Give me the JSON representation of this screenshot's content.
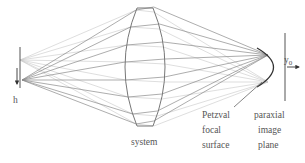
{
  "diagram": {
    "labels": {
      "object_height": "h",
      "system": "system",
      "petzval": [
        "Petzval",
        "focal",
        "surface"
      ],
      "paraxial": [
        "paraxial",
        "image",
        "plane"
      ],
      "image_height_main": "y",
      "image_height_sub": "0"
    },
    "colors": {
      "ray_dark": "#8a8a8a",
      "ray_light": "#c8c8c8",
      "lens": "#777777",
      "petzval": "#333333",
      "text": "#555555"
    }
  }
}
